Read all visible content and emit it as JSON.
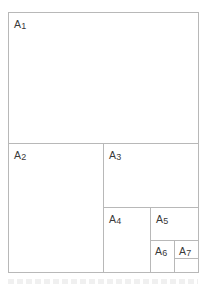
{
  "diagram": {
    "title_fragment": "",
    "cells": [
      {
        "id": "a1",
        "letter": "A",
        "number": "1"
      },
      {
        "id": "a2",
        "letter": "A",
        "number": "2"
      },
      {
        "id": "a3",
        "letter": "A",
        "number": "3"
      },
      {
        "id": "a4",
        "letter": "A",
        "number": "4"
      },
      {
        "id": "a5",
        "letter": "A",
        "number": "5"
      },
      {
        "id": "a6",
        "letter": "A",
        "number": "6"
      },
      {
        "id": "a7",
        "letter": "A",
        "number": "7"
      }
    ],
    "colors": {
      "border": "#b8b8b8",
      "label": "#3a3a3a",
      "background": "#ffffff"
    }
  }
}
